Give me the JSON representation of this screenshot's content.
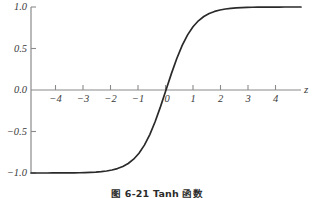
{
  "caption": "图 6-21   Tanh 函数",
  "colors": {
    "background": "#ffffff",
    "curve": "#2a2a2a",
    "axis": "#8a8a8a",
    "tick_text": "#3a3a3a",
    "caption_text": "#2b2b2b"
  },
  "axis_variable_label": "z",
  "y_ticks": [
    {
      "label": "1.0",
      "value": 1.0
    },
    {
      "label": "0.5",
      "value": 0.5
    },
    {
      "label": "0.0",
      "value": 0.0
    },
    {
      "label": "−0.5",
      "value": -0.5
    },
    {
      "label": "−1.0",
      "value": -1.0
    }
  ],
  "x_ticks": [
    {
      "label": "−4",
      "value": -4
    },
    {
      "label": "−3",
      "value": -3
    },
    {
      "label": "−2",
      "value": -2
    },
    {
      "label": "−1",
      "value": -1
    },
    {
      "label": "0",
      "value": 0
    },
    {
      "label": "1",
      "value": 1
    },
    {
      "label": "2",
      "value": 2
    },
    {
      "label": "3",
      "value": 3
    },
    {
      "label": "4",
      "value": 4
    }
  ],
  "chart_data": {
    "type": "line",
    "title": "图 6-21   Tanh 函数",
    "xlabel": "z",
    "ylabel": "",
    "xlim": [
      -5.0,
      5.0
    ],
    "ylim": [
      -1.0,
      1.0
    ],
    "grid": false,
    "legend": false,
    "function": "tanh(z)",
    "series": [
      {
        "name": "tanh(z)",
        "color": "#2a2a2a",
        "x": [
          -5.0,
          -4.8,
          -4.6,
          -4.4,
          -4.2,
          -4.0,
          -3.8,
          -3.6,
          -3.4,
          -3.2,
          -3.0,
          -2.8,
          -2.6,
          -2.4,
          -2.2,
          -2.0,
          -1.8,
          -1.6,
          -1.4,
          -1.2,
          -1.0,
          -0.8,
          -0.6,
          -0.4,
          -0.2,
          0.0,
          0.2,
          0.4,
          0.6,
          0.8,
          1.0,
          1.2,
          1.4,
          1.6,
          1.8,
          2.0,
          2.2,
          2.4,
          2.6,
          2.8,
          3.0,
          3.2,
          3.4,
          3.6,
          3.8,
          4.0,
          4.2,
          4.4,
          4.6,
          4.8,
          5.0
        ],
        "y": [
          -0.9999,
          -0.9999,
          -0.9998,
          -0.9998,
          -0.9996,
          -0.9993,
          -0.999,
          -0.9985,
          -0.9978,
          -0.9967,
          -0.9951,
          -0.9926,
          -0.989,
          -0.9837,
          -0.9757,
          -0.964,
          -0.9468,
          -0.9217,
          -0.8854,
          -0.8337,
          -0.7616,
          -0.664,
          -0.537,
          -0.3799,
          -0.1974,
          0.0,
          0.1974,
          0.3799,
          0.537,
          0.664,
          0.7616,
          0.8337,
          0.8854,
          0.9217,
          0.9468,
          0.964,
          0.9757,
          0.9837,
          0.989,
          0.9926,
          0.9951,
          0.9967,
          0.9978,
          0.9985,
          0.999,
          0.9993,
          0.9996,
          0.9998,
          0.9998,
          0.9999,
          0.9999
        ]
      }
    ],
    "annotations": [
      {
        "text": "z",
        "role": "x-axis-variable",
        "position": "axis-right-end"
      }
    ]
  }
}
